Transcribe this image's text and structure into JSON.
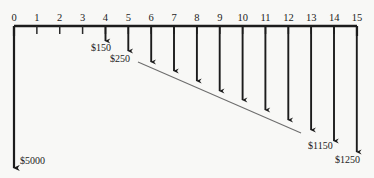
{
  "figure": {
    "type": "cash-flow-timeline",
    "title": "",
    "background_color": "#f8f8f6",
    "ink_color": "#1c1c1c",
    "envelope_color": "#6e6e6e"
  },
  "axis": {
    "label": "",
    "orientation": "horizontal",
    "tick_labels": [
      "0",
      "1",
      "2",
      "3",
      "4",
      "5",
      "6",
      "7",
      "8",
      "9",
      "10",
      "11",
      "12",
      "13",
      "14",
      "15"
    ],
    "min": 0,
    "max": 15,
    "tick_step": 1,
    "pixel_left": 14,
    "pixel_right": 357,
    "pixel_y": 26,
    "tick_length": 8
  },
  "chart_data": {
    "type": "bar",
    "title": "",
    "xlabel": "",
    "ylabel": "",
    "orientation": "down",
    "categories": [
      "0",
      "1",
      "2",
      "3",
      "4",
      "5",
      "6",
      "7",
      "8",
      "9",
      "10",
      "11",
      "12",
      "13",
      "14",
      "15"
    ],
    "values": [
      5000,
      0,
      0,
      0,
      150,
      250,
      350,
      450,
      550,
      650,
      750,
      850,
      950,
      1050,
      1150,
      1250
    ],
    "labeled_points": [
      {
        "period": 0,
        "text": "$5000"
      },
      {
        "period": 4,
        "text": "$150"
      },
      {
        "period": 5,
        "text": "$250"
      },
      {
        "period": 14,
        "text": "$1150"
      },
      {
        "period": 15,
        "text": "$1250"
      }
    ],
    "annotations": [
      {
        "name": "gradient-envelope",
        "style": "thin-line",
        "from_period": 5.4,
        "to_period": 12.5
      }
    ],
    "grid": false,
    "legend": null
  },
  "arrows": [
    {
      "period": 0,
      "x": 14,
      "y_end": 168,
      "head": "large",
      "label": "$5000",
      "label_x": 20,
      "label_y": 164
    },
    {
      "period": 4,
      "x": 105.5,
      "y_end": 41,
      "head": "small",
      "label": "$150",
      "label_x": 91,
      "label_y": 51
    },
    {
      "period": 5,
      "x": 128.3,
      "y_end": 51,
      "head": "small",
      "label": "$250",
      "label_x": 110,
      "label_y": 62
    },
    {
      "period": 6,
      "x": 151.2,
      "y_end": 62,
      "head": "small",
      "label": "",
      "label_x": 0,
      "label_y": 0
    },
    {
      "period": 7,
      "x": 174,
      "y_end": 71,
      "head": "small",
      "label": "",
      "label_x": 0,
      "label_y": 0
    },
    {
      "period": 8,
      "x": 196.9,
      "y_end": 81,
      "head": "small",
      "label": "",
      "label_x": 0,
      "label_y": 0
    },
    {
      "period": 9,
      "x": 219.7,
      "y_end": 91,
      "head": "small",
      "label": "",
      "label_x": 0,
      "label_y": 0
    },
    {
      "period": 10,
      "x": 242.6,
      "y_end": 100,
      "head": "small",
      "label": "",
      "label_x": 0,
      "label_y": 0
    },
    {
      "period": 11,
      "x": 265.4,
      "y_end": 110,
      "head": "small",
      "label": "",
      "label_x": 0,
      "label_y": 0
    },
    {
      "period": 12,
      "x": 288.3,
      "y_end": 120,
      "head": "small",
      "label": "",
      "label_x": 0,
      "label_y": 0
    },
    {
      "period": 13,
      "x": 311.1,
      "y_end": 130,
      "head": "small",
      "label": "",
      "label_x": 0,
      "label_y": 0
    },
    {
      "period": 14,
      "x": 334,
      "y_end": 141,
      "head": "small",
      "label": "$1150",
      "label_x": 308,
      "label_y": 149
    },
    {
      "period": 15,
      "x": 356.8,
      "y_end": 152,
      "head": "small",
      "label": "$1250",
      "label_x": 335,
      "label_y": 163
    }
  ],
  "envelope": {
    "name": "gradient-envelope-line",
    "x1": 138,
    "y1": 62,
    "x2": 301,
    "y2": 133
  }
}
